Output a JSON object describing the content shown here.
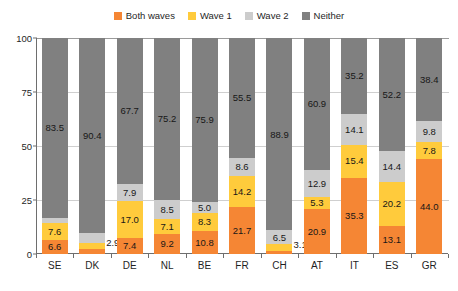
{
  "chart_data": {
    "type": "bar",
    "subtype": "stacked-bar-100",
    "title": "",
    "subtitle": "",
    "xlabel": "",
    "ylabel": "",
    "ylim": [
      0,
      100
    ],
    "yticks": [
      0,
      25,
      50,
      75,
      100
    ],
    "ytick_labels": [
      "0",
      "25",
      "50",
      "75",
      "100"
    ],
    "grid": true,
    "legend_position": "top-center",
    "categories": [
      "SE",
      "DK",
      "DE",
      "NL",
      "BE",
      "FR",
      "CH",
      "AT",
      "IT",
      "ES",
      "GR"
    ],
    "series": [
      {
        "name": "Both waves",
        "color": "#F58634",
        "values": [
          6.6,
          2.4,
          7.4,
          9.2,
          10.8,
          21.7,
          1.4,
          20.9,
          35.3,
          13.1,
          44.0
        ]
      },
      {
        "name": "Wave 1",
        "color": "#FFCB3C",
        "values": [
          7.6,
          2.9,
          17.0,
          7.1,
          8.3,
          14.2,
          3.1,
          5.3,
          15.4,
          20.2,
          7.8
        ]
      },
      {
        "name": "Wave 2",
        "color": "#CCCCCC",
        "values": [
          2.3,
          4.3,
          7.9,
          8.5,
          5.0,
          8.6,
          6.5,
          12.9,
          14.1,
          14.4,
          9.8
        ]
      },
      {
        "name": "Neither",
        "color": "#808080",
        "values": [
          83.5,
          90.4,
          67.7,
          75.2,
          75.9,
          55.5,
          88.9,
          60.9,
          35.2,
          52.2,
          38.4
        ]
      }
    ],
    "label_placement_outside": [
      {
        "category": "DK",
        "series": "Wave 1",
        "value": 2.9
      },
      {
        "category": "CH",
        "series": "Wave 1",
        "value": 3.1
      }
    ]
  },
  "legend": {
    "items": [
      {
        "label": "Both waves",
        "color": "#F58634"
      },
      {
        "label": "Wave 1",
        "color": "#FFCB3C"
      },
      {
        "label": "Wave 2",
        "color": "#CCCCCC"
      },
      {
        "label": "Neither",
        "color": "#808080"
      }
    ]
  }
}
